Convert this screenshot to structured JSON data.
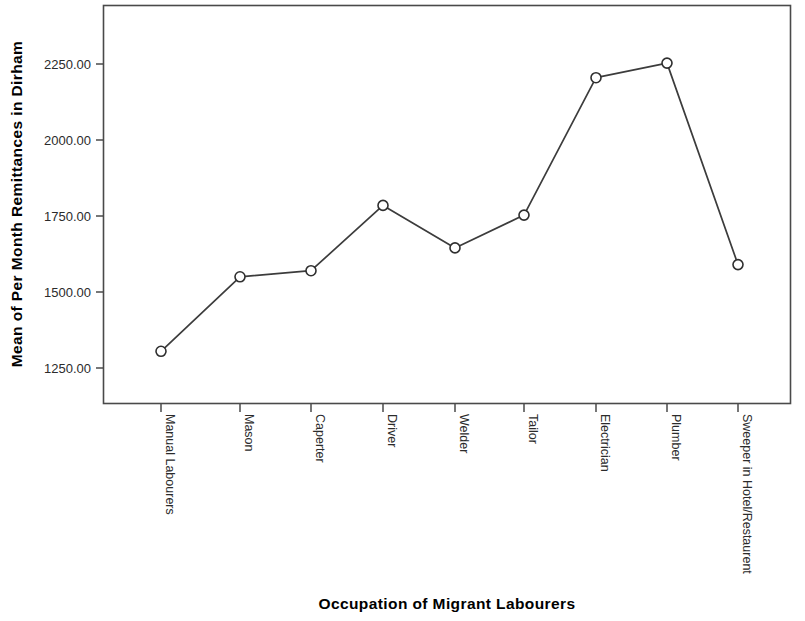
{
  "chart_data": {
    "type": "line",
    "title": "",
    "xlabel": "Occupation of Migrant Labourers",
    "ylabel": "Mean of Per Month Remittances in Dirham",
    "categories": [
      "Manual Labourers",
      "Mason",
      "Caperter",
      "Driver",
      "Welder",
      "Tailor",
      "Electrician",
      "Plumber",
      "Sweeper in Hotel/Restaurent"
    ],
    "values": [
      1305,
      1550,
      1570,
      1785,
      1645,
      1753,
      2205,
      2253,
      1590
    ],
    "series": [
      {
        "name": "Mean of Per Month Remittances in Dirham",
        "values": [
          1305,
          1550,
          1570,
          1785,
          1645,
          1753,
          2205,
          2253,
          1590
        ]
      }
    ],
    "ytick_labels": [
      "2250.00",
      "2000.00",
      "1750.00",
      "1500.00",
      "1250.00"
    ],
    "ytick_values": [
      2250,
      2000,
      1750,
      1500,
      1250
    ],
    "ylim": [
      1160,
      2330
    ],
    "grid": false,
    "legend": "none",
    "marker": "open-circle",
    "line_color": "#3c3c3c",
    "marker_fill": "#ffffff",
    "frame_color": "#4a4a4a",
    "background": "#ffffff"
  },
  "axes": {
    "y_title": "Mean of Per Month Remittances in Dirham",
    "x_title": "Occupation of Migrant Labourers"
  }
}
